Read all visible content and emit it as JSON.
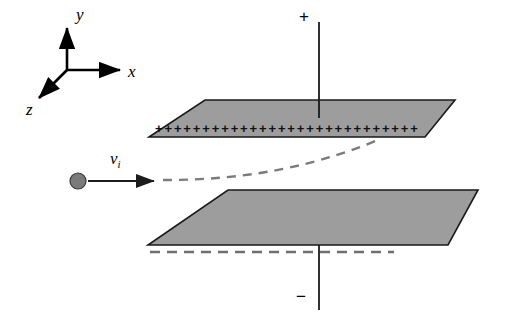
{
  "figure": {
    "background_color": "#ffffff",
    "width": 513,
    "height": 325
  },
  "axes": {
    "name": "coordinate-axes",
    "origin": [
      67,
      70
    ],
    "labels": {
      "x": "x",
      "y": "y",
      "z": "z"
    },
    "x_tip": [
      126,
      70
    ],
    "y_tip": [
      67,
      22
    ],
    "z_tip": [
      33,
      103
    ],
    "color": "#000000"
  },
  "plates": {
    "upper": {
      "name": "upper-plate",
      "charge_sign": "+",
      "fill_color": "#9d9d9d",
      "stroke_color": "#1a1a1a",
      "points": "205,100 455,100 425,137 149,137",
      "charge_count": 28,
      "charge_glyph": "+"
    },
    "lower": {
      "name": "lower-plate",
      "charge_sign": "-",
      "fill_color": "#9d9d9d",
      "stroke_color": "#1a1a1a",
      "points": "228,190 478,190 448,245 148,245"
    }
  },
  "terminals": {
    "positive": {
      "label": "+",
      "label_pos": [
        301,
        16
      ],
      "lead_from": [
        319,
        22
      ],
      "lead_to": [
        319,
        118
      ]
    },
    "negative": {
      "label": "−",
      "label_pos": [
        296,
        292
      ],
      "lead_from": [
        319,
        245
      ],
      "lead_to": [
        319,
        310
      ]
    }
  },
  "particle": {
    "name": "charged-particle",
    "center": [
      78,
      181
    ],
    "radius": 8,
    "fill_color": "#7a7a7a",
    "stroke_color": "#3a3a3a"
  },
  "velocity": {
    "label": "v",
    "subscript": "i",
    "label_pos": [
      113,
      152
    ],
    "arrow_from": [
      88,
      181
    ],
    "arrow_to": [
      160,
      181
    ],
    "color": "#222222"
  },
  "trajectory": {
    "name": "particle-trajectory",
    "style": "dashed",
    "color": "#7b7b7b",
    "path": "M163,180 C230,180 300,172 378,140"
  },
  "reference_line": {
    "name": "lower-plate-reference-line",
    "style": "dashed",
    "color": "#6f6f6f",
    "from": [
      150,
      252
    ],
    "to": [
      394,
      252
    ]
  }
}
